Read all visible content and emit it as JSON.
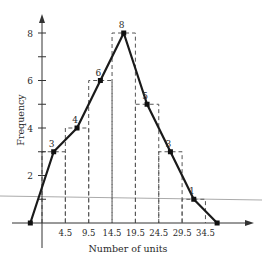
{
  "chart_data": {
    "type": "line",
    "subtype": "frequency polygon with histogram outline (dashed)",
    "title": "",
    "xlabel": "Number of units",
    "ylabel": "Frequency",
    "x_tick_labels": [
      "4.5",
      "9.5",
      "14.5",
      "19.5",
      "24.5",
      "29.5",
      "34.5"
    ],
    "x_ticks": [
      4.5,
      9.5,
      14.5,
      19.5,
      24.5,
      29.5,
      34.5
    ],
    "y_tick_labels": [
      "2",
      "4",
      "6",
      "8"
    ],
    "y_ticks_minor": [
      1,
      3,
      5,
      7
    ],
    "ylim": [
      0,
      8
    ],
    "class_boundaries": [
      -0.5,
      4.5,
      9.5,
      14.5,
      19.5,
      24.5,
      29.5,
      34.5
    ],
    "midpoints": [
      -3,
      2,
      7,
      12,
      17,
      22,
      27,
      32,
      37
    ],
    "values": [
      0,
      3,
      4,
      6,
      8,
      5,
      3,
      1,
      0
    ],
    "point_labels": [
      "",
      "3",
      "4",
      "6",
      "8",
      "5",
      "3",
      "1",
      ""
    ],
    "grid": false,
    "legend": null,
    "annotations": [
      "light gray near-horizontal line crossing the plot near frequency 1"
    ]
  },
  "axes": {
    "x_label": "Number of units",
    "y_label": "Frequency"
  },
  "colors": {
    "line": "#1a1a1a",
    "dashed": "#555555",
    "overlay_line": "#aaaaaa"
  }
}
